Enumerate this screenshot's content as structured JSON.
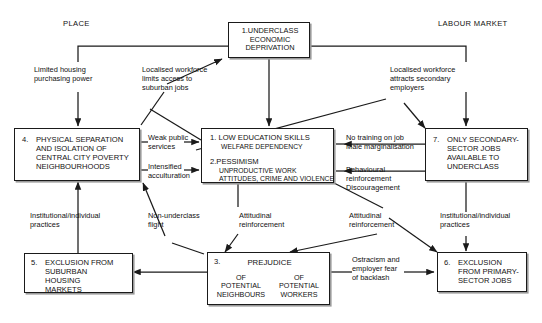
{
  "diagram": {
    "title_labels": {
      "place": "PLACE",
      "labour_market": "LABOUR MARKET"
    },
    "boxes": {
      "underclass": {
        "id": "1",
        "lines": "1.UNDERCLASS\nECONOMIC\nDEPRIVATION"
      },
      "low_education": {
        "heading": "1. LOW EDUCATION SKILLS",
        "sub": "WELFARE DEPENDENCY",
        "heading2": "2.PESSIMISM",
        "sub2": "UNPRODUCTIVE WORK\nATTITUDES, CRIME AND VIOLENCE"
      },
      "physical_separation": {
        "id": "4.",
        "lines": "PHYSICAL SEPARATION\nAND ISOLATION OF\nCENTRAL CITY POVERTY\nNEIGHBOURHOODS"
      },
      "secondary_sector": {
        "id": "7.",
        "lines": "ONLY SECONDARY-\nSECTOR JOBS\nAVAILABLE TO\nUNDERCLASS"
      },
      "exclusion_housing": {
        "id": "5.",
        "lines": "EXCLUSION FROM\nSUBURBAN\nHOUSING\nMARKETS"
      },
      "prejudice": {
        "id": "3.",
        "title": "PREJUDICE",
        "left": "OF\nPOTENTIAL\nNEIGHBOURS",
        "right": "OF\nPOTENTIAL\nWORKERS"
      },
      "exclusion_primary": {
        "id": "6.",
        "lines": "EXCLUSION\nFROM PRIMARY-\nSECTOR JOBS"
      }
    },
    "edge_labels": {
      "limited_housing": "Limited housing\npurchasing power",
      "localised_limits": "Localised workforce\nlimits access to\nsuburban jobs",
      "localised_attracts": "Localised workforce\nattracts secondary\nemployers",
      "no_training": "No training on job\nMale marginalisation",
      "weak_public": "Weak public\nservices",
      "intensified": "Intensified\nacculturation",
      "behavioural": "Behavioural\nreinforcement\nDiscouragement",
      "institutional_left": "Institutional/individual\npractices",
      "non_underclass": "Non-underclass\nflight",
      "attitudinal_left": "Attitudinal\nreinforcement",
      "attitudinal_right": "Attitudinal\nreinforcement",
      "institutional_right": "Institutional/individual\npractices",
      "ostracism": "Ostracism and\nemployer fear\nof backlash"
    },
    "colors": {
      "line": "#1a1a1a",
      "text": "#111111",
      "background": "#ffffff",
      "shadow": "#9a9a9a"
    }
  }
}
